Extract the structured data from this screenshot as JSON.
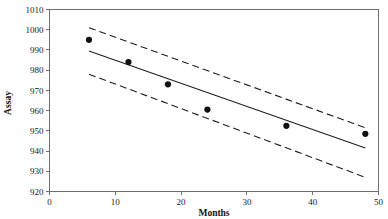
{
  "chart_data": {
    "type": "scatter",
    "title": "",
    "xlabel": "Months",
    "ylabel": "Assay",
    "xlim": [
      0,
      50
    ],
    "ylim": [
      920,
      1010
    ],
    "grid": false,
    "legend": null,
    "x_ticks": [
      0,
      10,
      20,
      30,
      40,
      50
    ],
    "x_tick_labels": [
      "0",
      "10",
      "20",
      "30",
      "40",
      "50"
    ],
    "y_ticks": [
      920,
      930,
      940,
      950,
      960,
      970,
      980,
      990,
      1000,
      1010
    ],
    "y_tick_labels": [
      "920",
      "930",
      "940",
      "950",
      "960",
      "970",
      "980",
      "990",
      "1000",
      "1010"
    ],
    "series": [
      {
        "name": "Observed assay",
        "type": "scatter",
        "x": [
          6,
          12,
          18,
          24,
          36,
          48
        ],
        "values": [
          995,
          984,
          973,
          960.5,
          952.5,
          948.5
        ]
      },
      {
        "name": "Regression fit",
        "type": "line",
        "style": "solid",
        "x": [
          6,
          48
        ],
        "values": [
          989.5,
          941.5
        ]
      },
      {
        "name": "Upper confidence limit",
        "type": "line",
        "style": "dashed",
        "x": [
          6,
          48
        ],
        "values": [
          1001,
          951.5
        ]
      },
      {
        "name": "Lower confidence limit",
        "type": "line",
        "style": "dashed",
        "x": [
          6,
          48
        ],
        "values": [
          978,
          927
        ]
      }
    ]
  },
  "axes": {
    "x_axis_title": "Months",
    "y_axis_title": "Assay"
  },
  "colors": {
    "line": "#1f1f1f",
    "point": "#111111",
    "frame": "#6e6e6e",
    "background": "#ffffff"
  }
}
